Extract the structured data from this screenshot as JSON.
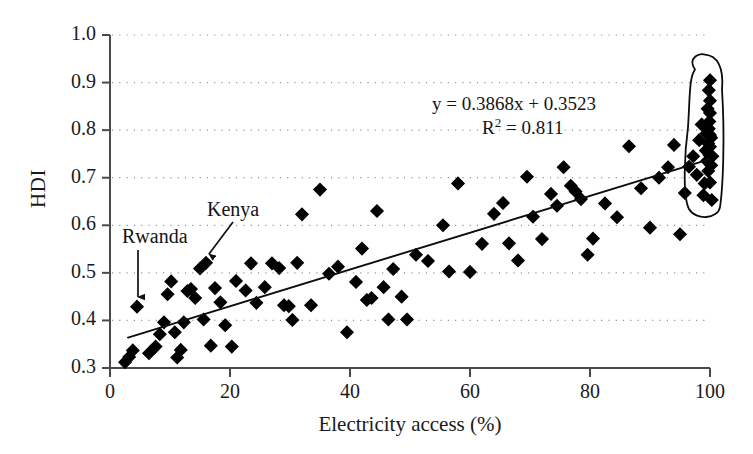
{
  "chart_data": {
    "type": "scatter",
    "title": "",
    "xlabel": "Electricity access (%)",
    "ylabel": "HDI",
    "xlim": [
      0,
      100
    ],
    "ylim": [
      0.3,
      1.0
    ],
    "xticks": [
      0,
      20,
      40,
      60,
      80,
      100
    ],
    "xtick_labels": [
      "0",
      "20",
      "40",
      "60",
      "80",
      "100"
    ],
    "yticks": [
      0.3,
      0.4,
      0.5,
      0.6,
      0.7,
      0.8,
      0.9,
      1.0
    ],
    "ytick_labels": [
      "0.3",
      "0.4",
      "0.5",
      "0.6",
      "0.7",
      "0.8",
      "0.9",
      "1.0"
    ],
    "grid": "horizontal-dotted",
    "legend": "none",
    "marker": "filled-diamond",
    "marker_color": "#000000",
    "trendline": {
      "type": "linear",
      "slope": 0.3868,
      "intercept": 0.3523,
      "r_squared": 0.811,
      "equation_text": "y = 0.3868x + 0.3523",
      "r2_text": "R2 = 0.811",
      "x_start": 3,
      "x_end": 100,
      "y_start": 0.364,
      "y_end": 0.739,
      "color": "#000000"
    },
    "annotations": [
      {
        "label": "Rwanda",
        "label_x": 5,
        "label_y": 0.575,
        "point_x": 4.5,
        "point_y": 0.429,
        "arrow": "down"
      },
      {
        "label": "Kenya",
        "label_x": 20,
        "label_y": 0.635,
        "point_x": 16,
        "point_y": 0.521,
        "arrow": "down-left"
      }
    ],
    "highlight_region": {
      "shape": "hand-drawn-ellipse",
      "description": "free-hand outline enclosing the dense cluster of high-electricity-access countries",
      "x_center": 99,
      "x_span": [
        96,
        101.5
      ],
      "y_span": [
        0.63,
        0.94
      ],
      "color": "#000000"
    },
    "points": [
      {
        "x": 2.5,
        "y": 0.312
      },
      {
        "x": 3.2,
        "y": 0.323
      },
      {
        "x": 3.8,
        "y": 0.337
      },
      {
        "x": 4.5,
        "y": 0.429
      },
      {
        "x": 6.5,
        "y": 0.331
      },
      {
        "x": 7.6,
        "y": 0.345
      },
      {
        "x": 8.3,
        "y": 0.371
      },
      {
        "x": 9.0,
        "y": 0.396
      },
      {
        "x": 9.6,
        "y": 0.455
      },
      {
        "x": 10.2,
        "y": 0.482
      },
      {
        "x": 10.8,
        "y": 0.375
      },
      {
        "x": 11.2,
        "y": 0.322
      },
      {
        "x": 11.8,
        "y": 0.338
      },
      {
        "x": 12.3,
        "y": 0.396
      },
      {
        "x": 12.9,
        "y": 0.462
      },
      {
        "x": 13.5,
        "y": 0.466
      },
      {
        "x": 14.2,
        "y": 0.447
      },
      {
        "x": 15.0,
        "y": 0.509
      },
      {
        "x": 15.6,
        "y": 0.402
      },
      {
        "x": 16.0,
        "y": 0.521
      },
      {
        "x": 16.8,
        "y": 0.347
      },
      {
        "x": 17.5,
        "y": 0.468
      },
      {
        "x": 18.4,
        "y": 0.438
      },
      {
        "x": 19.2,
        "y": 0.39
      },
      {
        "x": 20.3,
        "y": 0.345
      },
      {
        "x": 21.0,
        "y": 0.483
      },
      {
        "x": 22.6,
        "y": 0.463
      },
      {
        "x": 23.5,
        "y": 0.52
      },
      {
        "x": 24.4,
        "y": 0.437
      },
      {
        "x": 25.8,
        "y": 0.47
      },
      {
        "x": 27.0,
        "y": 0.52
      },
      {
        "x": 28.2,
        "y": 0.51
      },
      {
        "x": 29.0,
        "y": 0.432
      },
      {
        "x": 29.8,
        "y": 0.43
      },
      {
        "x": 30.4,
        "y": 0.401
      },
      {
        "x": 31.2,
        "y": 0.521
      },
      {
        "x": 32.0,
        "y": 0.623
      },
      {
        "x": 33.5,
        "y": 0.432
      },
      {
        "x": 35.0,
        "y": 0.675
      },
      {
        "x": 36.5,
        "y": 0.498
      },
      {
        "x": 38.0,
        "y": 0.513
      },
      {
        "x": 39.5,
        "y": 0.375
      },
      {
        "x": 41.0,
        "y": 0.481
      },
      {
        "x": 42.0,
        "y": 0.551
      },
      {
        "x": 42.8,
        "y": 0.443
      },
      {
        "x": 43.6,
        "y": 0.447
      },
      {
        "x": 44.5,
        "y": 0.63
      },
      {
        "x": 45.6,
        "y": 0.47
      },
      {
        "x": 46.4,
        "y": 0.402
      },
      {
        "x": 47.2,
        "y": 0.508
      },
      {
        "x": 48.6,
        "y": 0.45
      },
      {
        "x": 49.5,
        "y": 0.402
      },
      {
        "x": 51.0,
        "y": 0.538
      },
      {
        "x": 53.0,
        "y": 0.525
      },
      {
        "x": 55.5,
        "y": 0.6
      },
      {
        "x": 56.5,
        "y": 0.503
      },
      {
        "x": 58.0,
        "y": 0.688
      },
      {
        "x": 60.0,
        "y": 0.502
      },
      {
        "x": 62.0,
        "y": 0.561
      },
      {
        "x": 64.0,
        "y": 0.624
      },
      {
        "x": 65.5,
        "y": 0.647
      },
      {
        "x": 66.5,
        "y": 0.562
      },
      {
        "x": 68.0,
        "y": 0.526
      },
      {
        "x": 69.5,
        "y": 0.702
      },
      {
        "x": 70.5,
        "y": 0.618
      },
      {
        "x": 72.0,
        "y": 0.571
      },
      {
        "x": 73.5,
        "y": 0.666
      },
      {
        "x": 74.5,
        "y": 0.641
      },
      {
        "x": 75.6,
        "y": 0.722
      },
      {
        "x": 76.8,
        "y": 0.683
      },
      {
        "x": 77.6,
        "y": 0.671
      },
      {
        "x": 78.5,
        "y": 0.655
      },
      {
        "x": 79.6,
        "y": 0.538
      },
      {
        "x": 80.5,
        "y": 0.572
      },
      {
        "x": 82.5,
        "y": 0.646
      },
      {
        "x": 84.5,
        "y": 0.617
      },
      {
        "x": 86.5,
        "y": 0.766
      },
      {
        "x": 88.5,
        "y": 0.678
      },
      {
        "x": 90.0,
        "y": 0.595
      },
      {
        "x": 91.5,
        "y": 0.7
      },
      {
        "x": 93.0,
        "y": 0.722
      },
      {
        "x": 94.0,
        "y": 0.769
      },
      {
        "x": 95.0,
        "y": 0.581
      },
      {
        "x": 95.8,
        "y": 0.668
      },
      {
        "x": 96.5,
        "y": 0.723
      },
      {
        "x": 97.2,
        "y": 0.745
      },
      {
        "x": 97.8,
        "y": 0.706
      },
      {
        "x": 98.2,
        "y": 0.779
      },
      {
        "x": 98.6,
        "y": 0.812
      },
      {
        "x": 98.9,
        "y": 0.663
      },
      {
        "x": 99.1,
        "y": 0.688
      },
      {
        "x": 99.3,
        "y": 0.757
      },
      {
        "x": 99.4,
        "y": 0.793
      },
      {
        "x": 99.5,
        "y": 0.735
      },
      {
        "x": 99.6,
        "y": 0.845
      },
      {
        "x": 99.7,
        "y": 0.714
      },
      {
        "x": 99.7,
        "y": 0.772
      },
      {
        "x": 99.8,
        "y": 0.803
      },
      {
        "x": 99.8,
        "y": 0.884
      },
      {
        "x": 99.9,
        "y": 0.748
      },
      {
        "x": 99.9,
        "y": 0.818
      },
      {
        "x": 100.0,
        "y": 0.69
      },
      {
        "x": 100.0,
        "y": 0.765
      },
      {
        "x": 100.0,
        "y": 0.79
      },
      {
        "x": 100.0,
        "y": 0.836
      },
      {
        "x": 100.0,
        "y": 0.862
      },
      {
        "x": 100.0,
        "y": 0.905
      },
      {
        "x": 100.2,
        "y": 0.726
      },
      {
        "x": 100.2,
        "y": 0.784
      },
      {
        "x": 100.3,
        "y": 0.653
      },
      {
        "x": 100.4,
        "y": 0.745
      }
    ]
  },
  "axis": {
    "x_label": "Electricity access (%)",
    "y_label": "HDI"
  },
  "equation": {
    "line1": "y = 0.3868x + 0.3523",
    "r2_prefix": "R",
    "r2_exp": "2",
    "r2_suffix": " = 0.811"
  },
  "annotations": {
    "kenya": "Kenya",
    "rwanda": "Rwanda"
  }
}
